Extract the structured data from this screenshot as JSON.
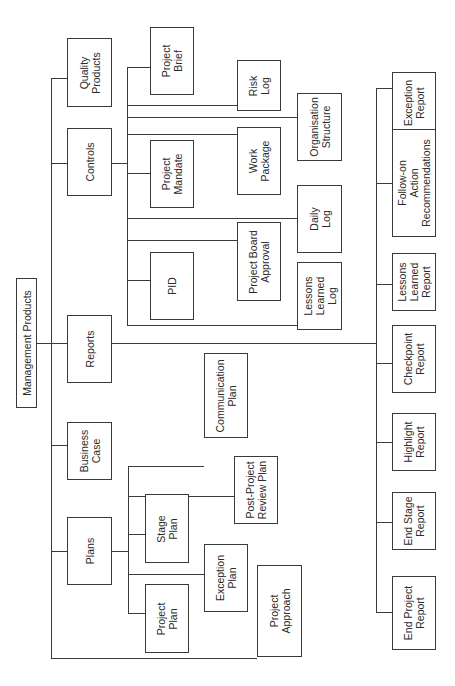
{
  "diagram": {
    "title": "Management Products",
    "orientation": "rotated-90-ccw",
    "root": {
      "label": "Management Products"
    },
    "categories": {
      "quality_products": {
        "label": "Quality\nProducts"
      },
      "controls": {
        "label": "Controls",
        "children": [
          {
            "label": "Project\nBrief"
          },
          {
            "label": "Risk\nLog"
          },
          {
            "label": "Organisation\nStructure"
          },
          {
            "label": "Work\nPackage"
          },
          {
            "label": "Project\nMandate"
          },
          {
            "label": "Daily\nLog"
          },
          {
            "label": "Project Board\nApproval"
          },
          {
            "label": "PID"
          },
          {
            "label": "Lessons\nLearned\nLog"
          }
        ]
      },
      "reports": {
        "label": "Reports",
        "children": [
          {
            "label": "Exception\nReport"
          },
          {
            "label": "Follow-on\nAction\nRecommendations"
          },
          {
            "label": "Lessons\nLearned\nReport"
          },
          {
            "label": "Checkpoint\nReport"
          },
          {
            "label": "Highlight\nReport"
          },
          {
            "label": "End Stage\nReport"
          },
          {
            "label": "End Project\nReport"
          }
        ]
      },
      "business_case": {
        "label": "Business\nCase"
      },
      "plans": {
        "label": "Plans",
        "children": [
          {
            "label": "Stage\nPlan"
          },
          {
            "label": "Project\nPlan"
          },
          {
            "label": "Communication\nPlan"
          },
          {
            "label": "Post-Project\nReview Plan"
          },
          {
            "label": "Exception\nPlan"
          }
        ]
      },
      "project_approach": {
        "label": "Project\nApproach"
      }
    }
  }
}
